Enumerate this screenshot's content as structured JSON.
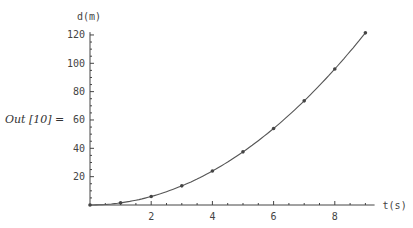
{
  "cell": {
    "output_label": "Out [10] ="
  },
  "chart_data": {
    "type": "scatter",
    "title": "",
    "xlabel": "t(s)",
    "ylabel": "d(m)",
    "x": [
      0,
      1,
      2,
      3,
      4,
      5,
      6,
      7,
      8,
      9
    ],
    "series": [
      {
        "name": "data points",
        "values": [
          0,
          1.5,
          6,
          13.5,
          24,
          37.5,
          54,
          73.5,
          96,
          121.5
        ]
      },
      {
        "name": "fit curve d = 1.5 t^2",
        "style": "line",
        "values": [
          0,
          1.5,
          6,
          13.5,
          24,
          37.5,
          54,
          73.5,
          96,
          121.5
        ]
      }
    ],
    "xticks": [
      2,
      4,
      6,
      8
    ],
    "yticks": [
      20,
      40,
      60,
      80,
      100,
      120
    ],
    "xlim": [
      0,
      9.3
    ],
    "ylim": [
      0,
      122
    ],
    "grid": false,
    "legend": null
  },
  "colors": {
    "axis": "#444444",
    "curve": "#555555",
    "point": "#444444"
  }
}
